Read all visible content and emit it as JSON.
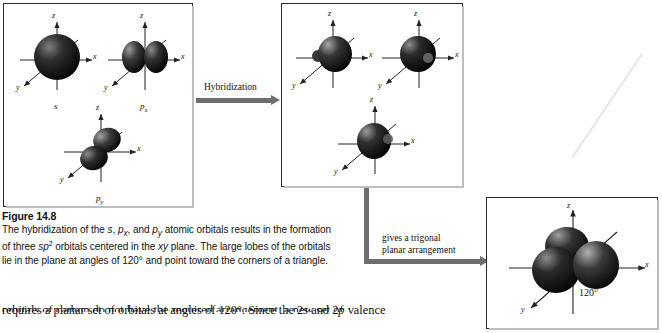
{
  "figure": {
    "number": "Figure 14.8",
    "caption_lines": [
      "The hybridization of the s, px, and py atomic orbitals results in the",
      "formation of three sp2 orbitals centered in the xy plane. The large",
      "lobes of the orbitals lie in the plane at angles of 120° and point",
      "toward the corners of a triangle."
    ]
  },
  "panel_atomic": {
    "name": "atomic-orbitals-panel",
    "orbitals": [
      {
        "label": "s",
        "sub": "",
        "axes": {
          "z": "z",
          "x": "x",
          "y": "y"
        }
      },
      {
        "label": "p",
        "sub": "x",
        "axes": {
          "z": "z",
          "x": "x",
          "y": "y"
        }
      },
      {
        "label": "p",
        "sub": "y",
        "axes": {
          "z": "z",
          "x": "x",
          "y": "y"
        }
      }
    ]
  },
  "panel_hybrid": {
    "name": "sp2-hybrid-orbitals-panel",
    "orbitals": [
      {
        "axes": {
          "z": "z",
          "x": "x",
          "y": "y"
        }
      },
      {
        "axes": {
          "z": "z",
          "x": "x",
          "y": "y"
        }
      },
      {
        "axes": {
          "z": "z",
          "x": "x",
          "y": "y"
        }
      }
    ]
  },
  "panel_trigonal": {
    "name": "trigonal-planar-panel",
    "angle_label": "120°",
    "axes": {
      "z": "z",
      "x": "x",
      "y": "y"
    }
  },
  "arrows": {
    "hybridization_label": "Hybridization",
    "trigonal_label_line1": "gives a trigonal",
    "trigonal_label_line2": "planar arrangement"
  },
  "body": {
    "line1": "requires a planar set of orbitals at angles of 120°. Since the 2s and 2p valence",
    "line2": "orbitals of carbon do not have the required arrangement, a new set of"
  },
  "colors": {
    "ink": "#111111",
    "panel_border": "#2a2a2a",
    "arrow_gray": "#6e6e6e",
    "orbital_dark": "#151515",
    "orbital_light": "#b8b8b8",
    "page_bg": "#ffffff"
  }
}
